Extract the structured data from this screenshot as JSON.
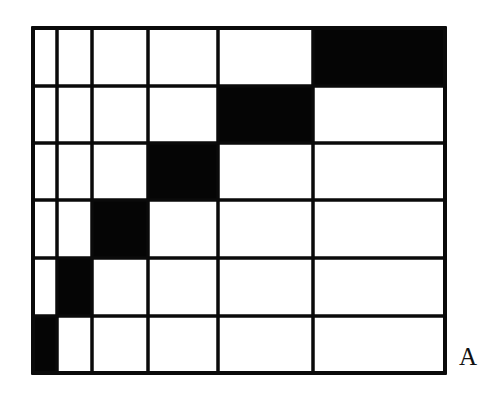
{
  "figure": {
    "label": "A",
    "line_color": "#0a0a0a",
    "fill_color": "#050505",
    "background": "#ffffff",
    "column_edges": [
      33,
      57,
      92,
      148,
      218,
      313,
      445
    ],
    "row_edges": [
      28,
      86,
      143,
      200,
      258,
      316,
      373
    ],
    "filled_cells": [
      {
        "row": 0,
        "col": 5
      },
      {
        "row": 1,
        "col": 4
      },
      {
        "row": 2,
        "col": 3
      },
      {
        "row": 3,
        "col": 2
      },
      {
        "row": 4,
        "col": 1
      },
      {
        "row": 5,
        "col": 0
      }
    ]
  }
}
